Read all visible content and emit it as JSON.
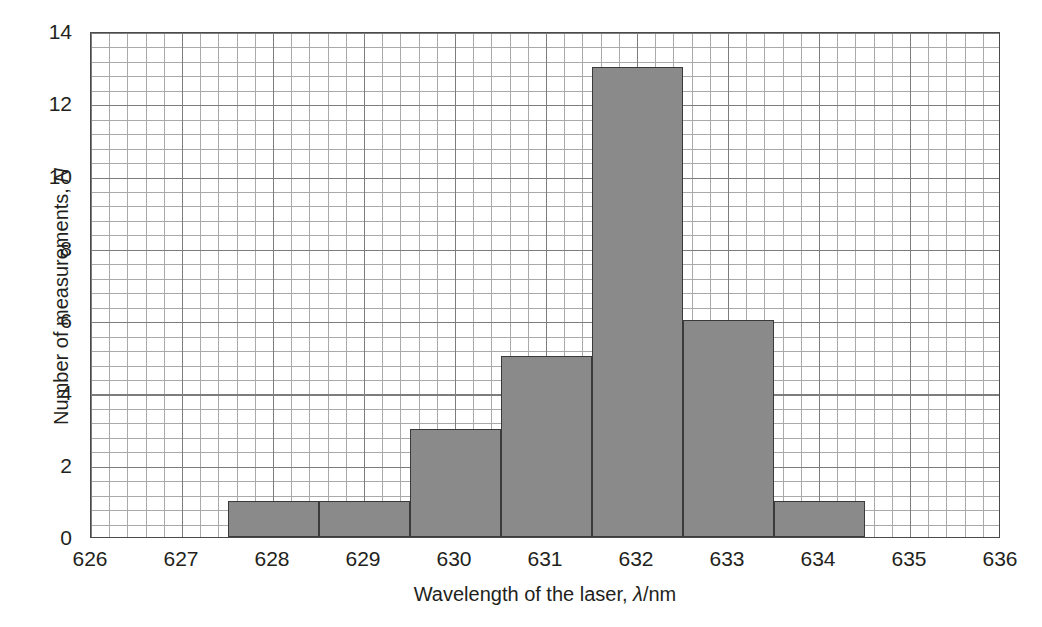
{
  "chart_data": {
    "type": "bar",
    "title": "",
    "subtitle": "",
    "xlabel": "Wavelength of the laser, λ/nm",
    "xlabel_symbol": "λ",
    "xlabel_prefix": "Wavelength of the laser, ",
    "xlabel_suffix": "/nm",
    "ylabel": "Number of measurements, N",
    "ylabel_prefix": "Number of measurements, ",
    "ylabel_symbol": "N",
    "xlim": [
      626,
      636
    ],
    "ylim": [
      0,
      14
    ],
    "x_ticks": [
      626,
      627,
      628,
      629,
      630,
      631,
      632,
      633,
      634,
      635,
      636
    ],
    "x_tick_labels": [
      "626",
      "627",
      "628",
      "629",
      "630",
      "631",
      "632",
      "633",
      "634",
      "635",
      "636"
    ],
    "y_ticks": [
      0,
      2,
      4,
      6,
      8,
      10,
      12,
      14
    ],
    "y_tick_labels": [
      "0",
      "2",
      "4",
      "6",
      "8",
      "10",
      "12",
      "14"
    ],
    "grid": true,
    "grid_minor_x_step": 0.2,
    "grid_minor_y_step": 0.4,
    "grid_major_x_step": 1,
    "grid_major_y_step": 2,
    "legend": null,
    "bin_width": 1,
    "bin_edges": [
      627.5,
      628.5,
      629.5,
      630.5,
      631.5,
      632.5,
      633.5,
      634.5
    ],
    "categories": [
      "628",
      "629",
      "630",
      "631",
      "632",
      "633",
      "634"
    ],
    "values": [
      1,
      1,
      3,
      5,
      13,
      6,
      1
    ],
    "bars": [
      {
        "label": "628",
        "x0": 627.5,
        "x1": 628.5,
        "value": 1
      },
      {
        "label": "629",
        "x0": 628.5,
        "x1": 629.5,
        "value": 1
      },
      {
        "label": "630",
        "x0": 629.5,
        "x1": 630.5,
        "value": 3
      },
      {
        "label": "631",
        "x0": 630.5,
        "x1": 631.5,
        "value": 5
      },
      {
        "label": "632",
        "x0": 631.5,
        "x1": 632.5,
        "value": 13
      },
      {
        "label": "633",
        "x0": 632.5,
        "x1": 633.5,
        "value": 6
      },
      {
        "label": "634",
        "x0": 633.5,
        "x1": 634.5,
        "value": 1
      }
    ],
    "total_measurements": 30
  },
  "colors": {
    "bar_fill": "#8a8a8a",
    "bar_edge": "#3a3a3a",
    "grid_minor": "#a9a9a9",
    "grid_major": "#7d7d7d",
    "axis_border": "#4a4a4a",
    "text": "#231f20",
    "background": "#ffffff"
  }
}
